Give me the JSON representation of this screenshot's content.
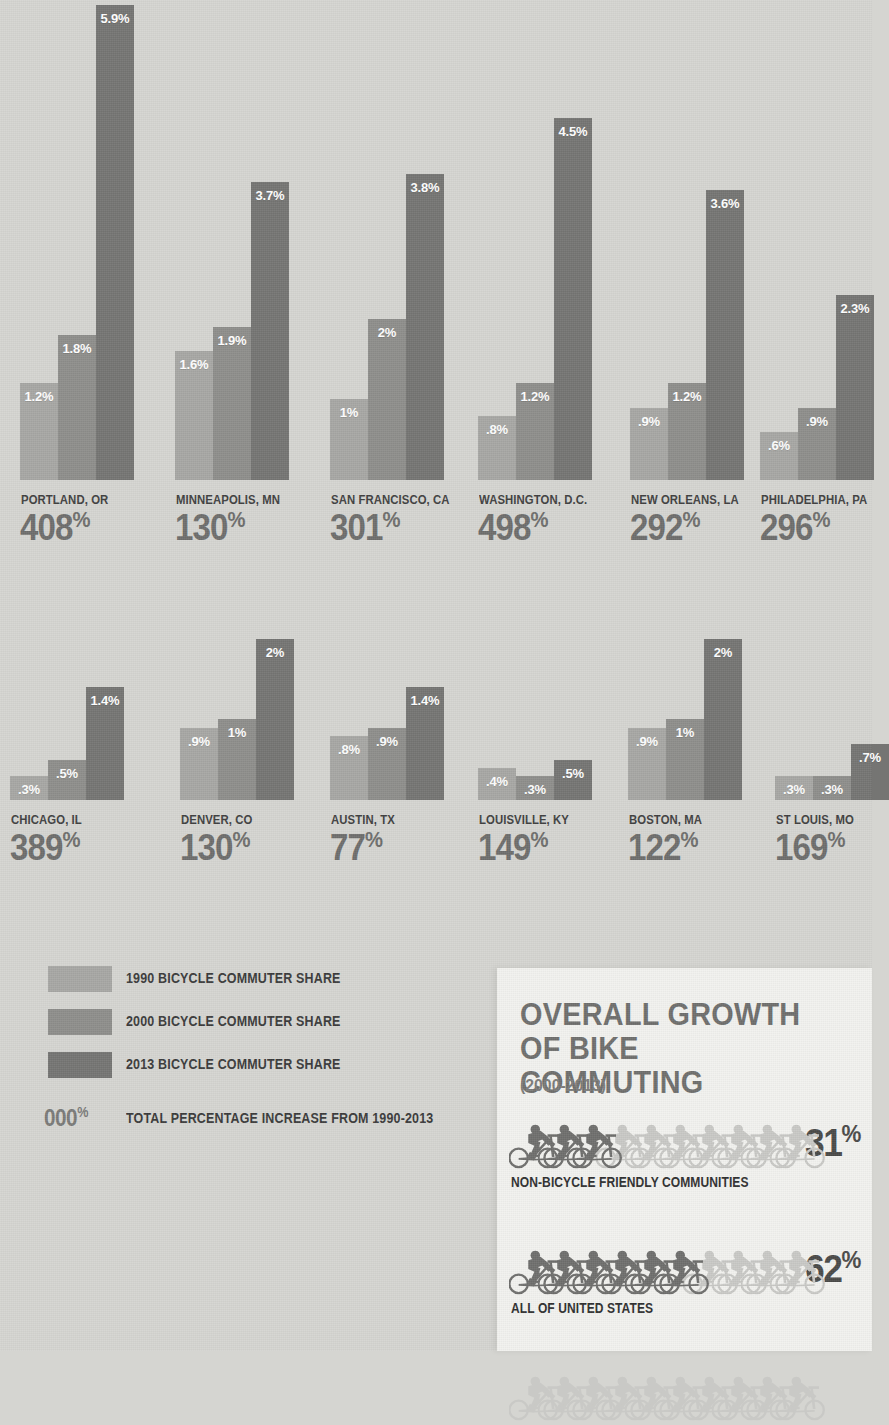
{
  "page": {
    "background_color": "#d5d5d1",
    "panel_color": "#f2f2ef"
  },
  "colors": {
    "series_1990": "#a7a7a4",
    "series_2000": "#8e8e8b",
    "series_2013": "#757573",
    "big_number": "#6e6e6c",
    "label_text": "#404040"
  },
  "chart_data": {
    "type": "bar",
    "xlabel": "",
    "ylabel": "Bicycle commuter share (%)",
    "ylim": [
      0,
      5.9
    ],
    "grid": false,
    "legend_position": "bottom-left",
    "series": [
      {
        "name": "1990 BICYCLE COMMUTER SHARE",
        "color": "#a7a7a4"
      },
      {
        "name": "2000 BICYCLE COMMUTER SHARE",
        "color": "#8e8e8b"
      },
      {
        "name": "2013 BICYCLE COMMUTER SHARE",
        "color": "#757573"
      }
    ],
    "categories": [
      "PORTLAND, OR",
      "MINNEAPOLIS, MN",
      "SAN FRANCISCO, CA",
      "WASHINGTON, D.C.",
      "NEW ORLEANS, LA",
      "PHILADELPHIA, PA",
      "CHICAGO, IL",
      "DENVER, CO",
      "AUSTIN, TX",
      "LOUISVILLE, KY",
      "BOSTON, MA",
      "ST LOUIS, MO"
    ],
    "values_1990": [
      1.2,
      1.6,
      1.0,
      0.8,
      0.9,
      0.6,
      0.3,
      0.9,
      0.8,
      0.4,
      0.9,
      0.3
    ],
    "values_2000": [
      1.8,
      1.9,
      2.0,
      1.2,
      1.2,
      0.9,
      0.5,
      1.0,
      0.9,
      0.3,
      1.0,
      0.3
    ],
    "values_2013": [
      5.9,
      3.7,
      3.8,
      4.5,
      3.6,
      2.3,
      1.4,
      2.0,
      1.4,
      0.5,
      2.0,
      0.7
    ],
    "total_increase_1990_2013": [
      408,
      130,
      301,
      498,
      292,
      296,
      389,
      130,
      77,
      149,
      122,
      169
    ]
  },
  "cities": [
    {
      "name": "PORTLAND, OR",
      "total": "408",
      "pct_suffix": "%",
      "bars": [
        {
          "label": "1.2%",
          "value": 1.2
        },
        {
          "label": "1.8%",
          "value": 1.8
        },
        {
          "label": "5.9%",
          "value": 5.9
        }
      ]
    },
    {
      "name": "MINNEAPOLIS, MN",
      "total": "130",
      "pct_suffix": "%",
      "bars": [
        {
          "label": "1.6%",
          "value": 1.6
        },
        {
          "label": "1.9%",
          "value": 1.9
        },
        {
          "label": "3.7%",
          "value": 3.7
        }
      ]
    },
    {
      "name": "SAN FRANCISCO, CA",
      "total": "301",
      "pct_suffix": "%",
      "bars": [
        {
          "label": "1%",
          "value": 1.0
        },
        {
          "label": "2%",
          "value": 2.0
        },
        {
          "label": "3.8%",
          "value": 3.8
        }
      ]
    },
    {
      "name": "WASHINGTON, D.C.",
      "total": "498",
      "pct_suffix": "%",
      "bars": [
        {
          "label": ".8%",
          "value": 0.8
        },
        {
          "label": "1.2%",
          "value": 1.2
        },
        {
          "label": "4.5%",
          "value": 4.5
        }
      ]
    },
    {
      "name": "NEW ORLEANS, LA",
      "total": "292",
      "pct_suffix": "%",
      "bars": [
        {
          "label": ".9%",
          "value": 0.9
        },
        {
          "label": "1.2%",
          "value": 1.2
        },
        {
          "label": "3.6%",
          "value": 3.6
        }
      ]
    },
    {
      "name": "PHILADELPHIA, PA",
      "total": "296",
      "pct_suffix": "%",
      "bars": [
        {
          "label": ".6%",
          "value": 0.6
        },
        {
          "label": ".9%",
          "value": 0.9
        },
        {
          "label": "2.3%",
          "value": 2.3
        }
      ]
    },
    {
      "name": "CHICAGO, IL",
      "total": "389",
      "pct_suffix": "%",
      "bars": [
        {
          "label": ".3%",
          "value": 0.3
        },
        {
          "label": ".5%",
          "value": 0.5
        },
        {
          "label": "1.4%",
          "value": 1.4
        }
      ]
    },
    {
      "name": "DENVER, CO",
      "total": "130",
      "pct_suffix": "%",
      "bars": [
        {
          "label": ".9%",
          "value": 0.9
        },
        {
          "label": "1%",
          "value": 1.0
        },
        {
          "label": "2%",
          "value": 2.0
        }
      ]
    },
    {
      "name": "AUSTIN, TX",
      "total": "77",
      "pct_suffix": "%",
      "bars": [
        {
          "label": ".8%",
          "value": 0.8
        },
        {
          "label": ".9%",
          "value": 0.9
        },
        {
          "label": "1.4%",
          "value": 1.4
        }
      ]
    },
    {
      "name": "LOUISVILLE, KY",
      "total": "149",
      "pct_suffix": "%",
      "bars": [
        {
          "label": ".4%",
          "value": 0.4
        },
        {
          "label": ".3%",
          "value": 0.3
        },
        {
          "label": ".5%",
          "value": 0.5
        }
      ]
    },
    {
      "name": "BOSTON, MA",
      "total": "122",
      "pct_suffix": "%",
      "bars": [
        {
          "label": ".9%",
          "value": 0.9
        },
        {
          "label": "1%",
          "value": 1.0
        },
        {
          "label": "2%",
          "value": 2.0
        }
      ]
    },
    {
      "name": "ST LOUIS, MO",
      "total": "169",
      "pct_suffix": "%",
      "bars": [
        {
          "label": ".3%",
          "value": 0.3
        },
        {
          "label": ".3%",
          "value": 0.3
        },
        {
          "label": ".7%",
          "value": 0.7
        }
      ]
    }
  ],
  "legend": {
    "items": [
      {
        "label": "1990 BICYCLE COMMUTER SHARE",
        "color": "#a7a7a4"
      },
      {
        "label": "2000 BICYCLE COMMUTER SHARE",
        "color": "#8e8e8b"
      },
      {
        "label": "2013 BICYCLE COMMUTER SHARE",
        "color": "#757573"
      }
    ],
    "total_key_number": "000",
    "total_key_suffix": "%",
    "total_key_label": "TOTAL PERCENTAGE INCREASE FROM 1990-2013"
  },
  "panel": {
    "title": "OVERALL GROWTH OF BIKE COMMUTING",
    "subtitle": "(2000-2013)",
    "rows": [
      {
        "value": "31",
        "suffix": "%",
        "caption": "NON-BICYCLE FRIENDLY COMMUNITIES",
        "filled": 3,
        "total_icons": 10,
        "icon": "bicycle-icon"
      },
      {
        "value": "62",
        "suffix": "%",
        "caption": "ALL OF UNITED STATES",
        "filled": 6,
        "total_icons": 10,
        "icon": "bicycle-icon"
      },
      {
        "value": "",
        "suffix": "",
        "caption": "",
        "filled": 0,
        "total_icons": 10,
        "icon": "bicycle-icon"
      }
    ]
  }
}
